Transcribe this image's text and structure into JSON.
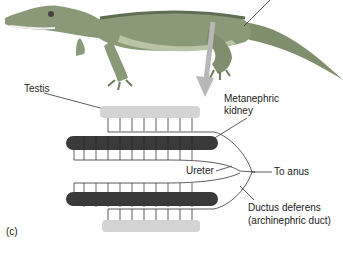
{
  "labels": {
    "testis": "Testis",
    "kidney_line1": "Metanephric",
    "kidney_line2": "kidney",
    "ureter": "Ureter",
    "to_anus": "To anus",
    "ductus_line1": "Ductus deferens",
    "ductus_line2": "(archinephric duct)",
    "panel": "(c)"
  },
  "colors": {
    "body": "#8a9a78",
    "body_dark": "#5f6e52",
    "belly": "#b9c3a6",
    "arrow": "#b8b8b8",
    "testis": "#d4d4d4",
    "kidney": "#3a3a3a",
    "line": "#333333"
  }
}
